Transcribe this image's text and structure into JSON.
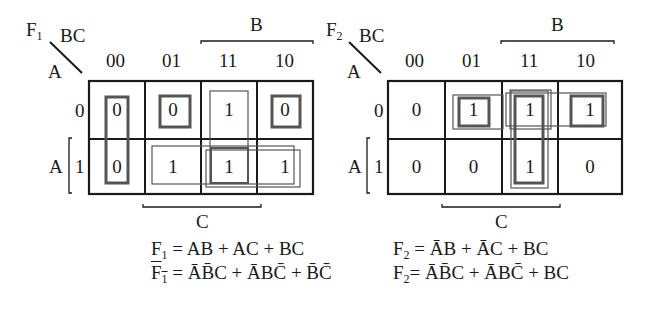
{
  "maps": [
    {
      "name": "F1",
      "title_main": "F",
      "title_sub": "1",
      "col_var": "BC",
      "row_var": "A",
      "col_headers": [
        "00",
        "01",
        "11",
        "10"
      ],
      "row_headers": [
        "0",
        "1"
      ],
      "row_bracket_label": "A",
      "top_bracket_label": "B",
      "bottom_bracket_label": "C",
      "cells": [
        [
          "0",
          "0",
          "1",
          "0"
        ],
        [
          "0",
          "1",
          "1",
          "1"
        ]
      ],
      "expressions": [
        {
          "lhs_main": "F",
          "lhs_sub": "1",
          "lhs_bar": false,
          "rhs": "= AB + AC + BC"
        },
        {
          "lhs_main": "F",
          "lhs_sub": "1",
          "lhs_bar": true,
          "rhs_terms": [
            "ĀB̄C",
            "ĀBC̄",
            "B̄C̄"
          ],
          "rhs": "= ĀB̄C + ĀBC̄ + B̄C̄"
        }
      ]
    },
    {
      "name": "F2",
      "title_main": "F",
      "title_sub": "2",
      "col_var": "BC",
      "row_var": "A",
      "col_headers": [
        "00",
        "01",
        "11",
        "10"
      ],
      "row_headers": [
        "0",
        "1"
      ],
      "row_bracket_label": "A",
      "top_bracket_label": "B",
      "bottom_bracket_label": "C",
      "cells": [
        [
          "0",
          "1",
          "1",
          "1"
        ],
        [
          "0",
          "0",
          "1",
          "0"
        ]
      ],
      "expressions": [
        {
          "lhs_main": "F",
          "lhs_sub": "2",
          "lhs_bar": false,
          "rhs": "= ĀB + ĀC + BC"
        },
        {
          "lhs_main": "F",
          "lhs_sub": "2",
          "lhs_bar": false,
          "rhs": "= ĀB̄C + ĀBC̄ + BC"
        }
      ]
    }
  ],
  "text": {
    "f1_eq1_rhs": "= AB + AC + BC",
    "f1_eq2_p1": "= ",
    "f2_eq1_rhs_eq": "= ",
    "plus": " + ",
    "A": "A",
    "B": "B",
    "C": "C",
    "BC": "BC"
  }
}
